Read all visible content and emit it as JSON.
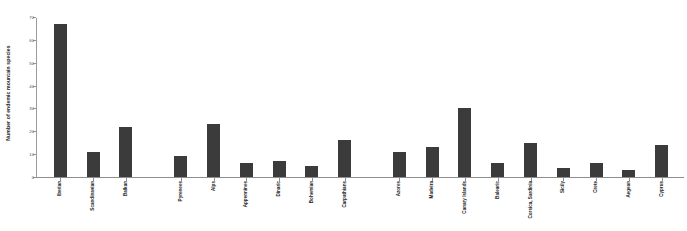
{
  "chart_data": {
    "type": "bar",
    "title": "",
    "xlabel": "",
    "ylabel": "Number of endemic mountain species",
    "ylim": [
      0,
      70
    ],
    "yticks": [
      0,
      10,
      20,
      30,
      40,
      50,
      60,
      70
    ],
    "grid": false,
    "legend": null,
    "bar_color": "#3b3b3b",
    "categories": [
      "Iberian",
      "Scandinavian",
      "Balkan",
      "Pyrenees",
      "Alps",
      "Appennines",
      "Dinaric",
      "Bohemian",
      "Carpathians",
      "Azores",
      "Madeira",
      "Canary Islands",
      "Balearic",
      "Corsica, Sardinia",
      "Sicily",
      "Crete",
      "Aegean",
      "Cyprus"
    ],
    "values": [
      67,
      11,
      22,
      9,
      23,
      6,
      7,
      5,
      16,
      11,
      13,
      30,
      6,
      15,
      4,
      6,
      3,
      14
    ]
  }
}
